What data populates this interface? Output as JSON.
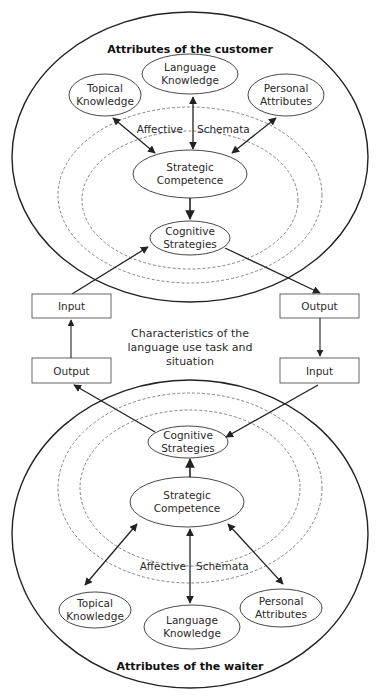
{
  "top": {
    "title": "Attributes of the customer",
    "topical": [
      "Topical",
      "Knowledge"
    ],
    "language": [
      "Language",
      "Knowledge"
    ],
    "personal": [
      "Personal",
      "Attributes"
    ],
    "affective": "Affective",
    "schemata": "Schemata",
    "strategic": [
      "Strategic",
      "Competence"
    ],
    "cognitive": [
      "Cognitive",
      "Strategies"
    ]
  },
  "middle": {
    "left_input": "Input",
    "left_output": "Output",
    "right_output": "Output",
    "right_input": "Input",
    "center": [
      "Characteristics of the",
      "language use task and",
      "situation"
    ]
  },
  "bottom": {
    "title": "Attributes of the waiter",
    "topical": [
      "Topical",
      "Knowledge"
    ],
    "language": [
      "Language",
      "Knowledge"
    ],
    "personal": [
      "Personal",
      "Attributes"
    ],
    "affective": "Affective",
    "schemata": "Schemata",
    "strategic": [
      "Strategic",
      "Competence"
    ],
    "cognitive": [
      "Cognitive",
      "Strategies"
    ]
  },
  "colors": {
    "line": "#222222",
    "dashed": "#666666",
    "box_border": "#555555"
  }
}
